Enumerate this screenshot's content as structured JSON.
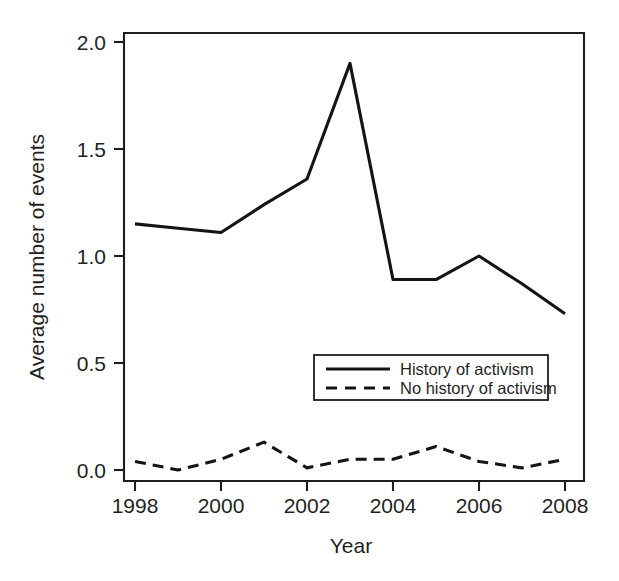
{
  "chart_data": {
    "type": "line",
    "title": "",
    "xlabel": "Year",
    "ylabel": "Average number of events",
    "xlim": [
      1998,
      2008
    ],
    "ylim": [
      0.0,
      2.0
    ],
    "grid": false,
    "legend_position": "inside-center-right",
    "x": [
      1998,
      1999,
      2000,
      2001,
      2002,
      2003,
      2004,
      2005,
      2006,
      2007,
      2008
    ],
    "xtick_labels": [
      "1998",
      "2000",
      "2002",
      "2004",
      "2006",
      "2008"
    ],
    "xtick_values": [
      1998,
      2000,
      2002,
      2004,
      2006,
      2008
    ],
    "ytick_labels": [
      "0.0",
      "0.5",
      "1.0",
      "1.5",
      "2.0"
    ],
    "ytick_values": [
      0.0,
      0.5,
      1.0,
      1.5,
      2.0
    ],
    "series": [
      {
        "name": "History of activism",
        "style": "solid",
        "color": "#141414",
        "values": [
          1.15,
          1.13,
          1.11,
          1.24,
          1.36,
          1.9,
          0.89,
          0.89,
          1.0,
          0.87,
          0.73
        ]
      },
      {
        "name": "No history of activism",
        "style": "dashed",
        "color": "#141414",
        "values": [
          0.04,
          0.0,
          0.05,
          0.13,
          0.01,
          0.05,
          0.05,
          0.11,
          0.04,
          0.01,
          0.05
        ]
      }
    ]
  },
  "legend": {
    "entries": [
      {
        "label": "History of activism",
        "style": "solid"
      },
      {
        "label": "No history of activism",
        "style": "dashed"
      }
    ]
  },
  "axes": {
    "x_title": "Year",
    "y_title": "Average number of events",
    "y_ticks": [
      "2.0",
      "1.5",
      "1.0",
      "0.5",
      "0.0"
    ],
    "x_ticks": [
      "1998",
      "2000",
      "2002",
      "2004",
      "2006",
      "2008"
    ]
  }
}
